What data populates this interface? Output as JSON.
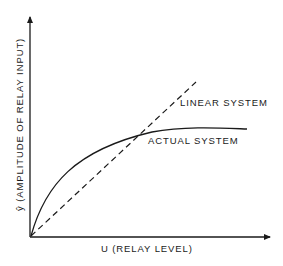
{
  "diagram": {
    "type": "line",
    "x_axis": {
      "label": "U (RELAY LEVEL)"
    },
    "y_axis": {
      "label": "ŷ (AMPLITUDE OF RELAY INPUT)",
      "symbol": "ŷ",
      "text": "(AMPLITUDE OF RELAY INPUT)"
    },
    "curves": [
      {
        "name": "LINEAR SYSTEM",
        "style": "dashed",
        "shape": "straight line through origin"
      },
      {
        "name": "ACTUAL SYSTEM",
        "style": "solid",
        "shape": "concave curve saturating, crosses linear line"
      }
    ],
    "labels": {
      "linear": "LINEAR SYSTEM",
      "actual": "ACTUAL SYSTEM"
    },
    "colors": {
      "ink": "#1a1a1a",
      "background": "#ffffff"
    }
  }
}
